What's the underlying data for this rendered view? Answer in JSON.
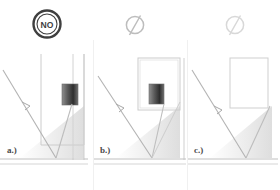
{
  "figure": {
    "type": "three-panel optical ray diagram",
    "panel_count": 3
  },
  "panels": [
    {
      "id": "a",
      "label": "a.)",
      "status_icon": {
        "name": "no-circle-icon",
        "text": "NO",
        "style": "dark outlined circle with NO text",
        "color": "#3f3f3f"
      },
      "sensor_block": {
        "present": true,
        "position": "upper-right inside housing",
        "fill": "gradient gray to dark"
      },
      "rays": {
        "incoming": "diagonal from upper-left down to ground",
        "reflected": "from ground up to sensor block"
      },
      "ground_shadow": true
    },
    {
      "id": "b",
      "label": "b.)",
      "status_icon": {
        "name": "slashed-circle-icon",
        "text": "",
        "style": "light gray circle with diagonal slash",
        "color": "#bdbdbd"
      },
      "sensor_block": {
        "present": true,
        "position": "inside raised housing box",
        "fill": "gradient gray to dark"
      },
      "rays": {
        "incoming": "diagonal from upper-left down to ground",
        "reflected": "from ground up to sensor block"
      },
      "ground_shadow": true
    },
    {
      "id": "c",
      "label": "c.)",
      "status_icon": {
        "name": "slashed-circle-icon",
        "text": "",
        "style": "very light gray circle with diagonal slash",
        "color": "#d8d8d8"
      },
      "sensor_block": {
        "present": false,
        "position": "",
        "fill": ""
      },
      "rays": {
        "incoming": "diagonal from upper-left down to ground",
        "reflected": "from ground up to the right"
      },
      "ground_shadow": true
    }
  ],
  "colors": {
    "line": "#b9b9b9",
    "line_dark": "#9a9a9a",
    "ground": "#c9c9c9",
    "shadow": "#e3e3e3",
    "icon_dark": "#3f3f3f",
    "icon_light": "#bdbdbd",
    "icon_faint": "#d8d8d8",
    "divider": "#f0f0f0",
    "label_text": "#4a4a4a",
    "background": "#ffffff"
  }
}
